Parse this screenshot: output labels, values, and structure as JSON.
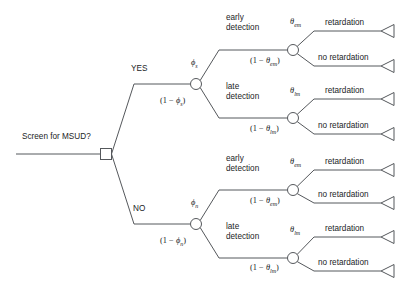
{
  "diagram": {
    "type": "decision-tree",
    "title_label": "Screen for MSUD?",
    "decision_node": "square-decision-node",
    "branches": {
      "yes_label": "YES",
      "no_label": "NO"
    },
    "probabilities": {
      "phi_s": "ϕs",
      "one_minus_phi_s": "(1 − ϕs)",
      "phi_n": "ϕn",
      "one_minus_phi_n": "(1 − ϕn)",
      "theta_em": "θem",
      "one_minus_theta_em": "(1 − θem)",
      "theta_lm": "θlm",
      "one_minus_theta_lm": "(1 − θlm)"
    },
    "detection_labels": {
      "early_line1": "early",
      "early_line2": "detection",
      "late_line1": "late",
      "late_line2": "detection"
    },
    "outcomes": {
      "retardation": "retardation",
      "no_retardation": "no retardation"
    },
    "colors": {
      "stroke": "#55585c",
      "text": "#222426",
      "background": "#ffffff"
    },
    "structure": [
      {
        "branch": "YES",
        "prob_upper": "ϕs",
        "prob_lower": "(1 − ϕs)",
        "children": [
          {
            "detection": "early detection",
            "prob_upper": "θem",
            "prob_lower": "(1 − θem)",
            "outcomes": [
              "retardation",
              "no retardation"
            ]
          },
          {
            "detection": "late detection",
            "prob_upper": "θlm",
            "prob_lower": "(1 − θlm)",
            "outcomes": [
              "retardation",
              "no retardation"
            ]
          }
        ]
      },
      {
        "branch": "NO",
        "prob_upper": "ϕn",
        "prob_lower": "(1 − ϕn)",
        "children": [
          {
            "detection": "early detection",
            "prob_upper": "θem",
            "prob_lower": "(1 − θem)",
            "outcomes": [
              "retardation",
              "no retardation"
            ]
          },
          {
            "detection": "late detection",
            "prob_upper": "θlm",
            "prob_lower": "(1 − θlm)",
            "outcomes": [
              "retardation",
              "no retardation"
            ]
          }
        ]
      }
    ]
  }
}
